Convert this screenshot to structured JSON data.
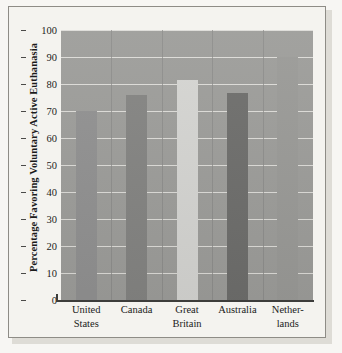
{
  "chart_data": {
    "type": "bar",
    "title": "",
    "xlabel": "",
    "ylabel": "Percentage Favoring Voluntary Active Euthanasia",
    "categories": [
      "United States",
      "Canada",
      "Great Britain",
      "Australia",
      "Netherlands"
    ],
    "category_lines": [
      [
        "United",
        "States"
      ],
      [
        "Canada",
        ""
      ],
      [
        "Great",
        "Britain"
      ],
      [
        "Australia",
        ""
      ],
      [
        "Nether-",
        "lands"
      ]
    ],
    "values": [
      70,
      76,
      81.5,
      76.5,
      90
    ],
    "ylim": [
      0,
      100
    ],
    "yticks": [
      0,
      10,
      20,
      30,
      40,
      50,
      60,
      70,
      80,
      90,
      100
    ],
    "ytick_labels": [
      "0",
      "10",
      "20",
      "30",
      "40",
      "50",
      "60",
      "70",
      "80",
      "90",
      "100"
    ],
    "grid": true,
    "legend": "none",
    "bar_colors": [
      "#919191",
      "#848482",
      "#d5d5d2",
      "#6e6e6c",
      "#9a9a97"
    ],
    "plot_background": "#9d9d9a",
    "gridline_color": "#e9e8e3",
    "axis_color": "#3d3d3b",
    "text_color": "#1b1b1b"
  }
}
